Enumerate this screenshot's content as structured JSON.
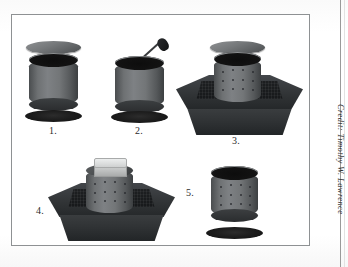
{
  "figure": {
    "caption_credit": "Credit: Timothy W. Lawrence",
    "background_color": "#ffffff",
    "frame_color": "#8e9193",
    "steps": [
      {
        "number": "1.",
        "name": "cylinder-with-lid-and-base",
        "description": "Plain cylinder shown exploded with a flat disc lid above and a dark base disc below",
        "parts": [
          "lid-disc",
          "plain-cylinder",
          "base-disc"
        ]
      },
      {
        "number": "2.",
        "name": "cylinder-with-tamping-rod",
        "description": "Open-top cylinder with a tamping rod inserted diagonally from upper right",
        "parts": [
          "open-cylinder",
          "tamping-rod",
          "base-disc"
        ]
      },
      {
        "number": "3.",
        "name": "perforated-cylinder-in-tray",
        "description": "Perforated cylinder standing in a dark square tray with lid disc floating above",
        "parts": [
          "lid-disc",
          "perforated-cylinder",
          "square-tray"
        ]
      },
      {
        "number": "4.",
        "name": "perforated-cylinder-with-weight",
        "description": "Perforated cylinder in the square tray with a light rectangular weight block on top",
        "parts": [
          "weight-block",
          "perforated-cylinder",
          "square-tray"
        ]
      },
      {
        "number": "5.",
        "name": "perforated-cylinder-and-base",
        "description": "Perforated cylinder removed from the tray, shown above a dark base disc",
        "parts": [
          "perforated-cylinder",
          "base-disc"
        ]
      }
    ]
  },
  "colors": {
    "cylinder_light": "#7e8184",
    "cylinder_dark": "#3c3f41",
    "tray_dark": "#25282a",
    "weight_light": "#d9dbdb",
    "page": "#fcfcfc"
  }
}
